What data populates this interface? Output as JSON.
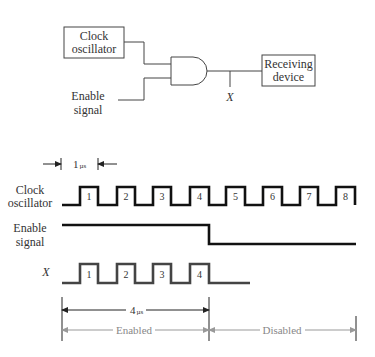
{
  "circuit": {
    "clock_box": {
      "line1": "Clock",
      "line2": "oscillator"
    },
    "enable_input": {
      "line1": "Enable",
      "line2": "signal"
    },
    "gate": "AND",
    "output_node": "X",
    "receiver_box": {
      "line1": "Receiving",
      "line2": "device"
    }
  },
  "timing": {
    "period_marker": {
      "value": "1",
      "unit": "µs"
    },
    "rows": {
      "clock": {
        "line1": "Clock",
        "line2": "oscillator"
      },
      "enable": {
        "line1": "Enable",
        "line2": "signal"
      },
      "x": {
        "label": "X"
      }
    },
    "clock_pulse_labels": [
      "1",
      "2",
      "3",
      "4",
      "5",
      "6",
      "7",
      "8"
    ],
    "x_pulse_labels": [
      "1",
      "2",
      "3",
      "4"
    ],
    "duration_marker": {
      "value": "4",
      "unit": "µs"
    },
    "phases": {
      "enabled": "Enabled",
      "disabled": "Disabled"
    }
  },
  "colors": {
    "line": "#111111",
    "wave": "#333333",
    "dimension": "#888888"
  }
}
